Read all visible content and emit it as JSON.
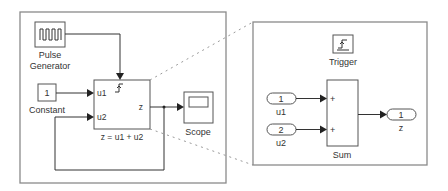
{
  "parent_model": {
    "pulse_generator": {
      "label_line1": "Pulse",
      "label_line2": "Generator",
      "icon": "pulse-wave-icon"
    },
    "constant": {
      "value": "1",
      "label": "Constant"
    },
    "subsystem": {
      "inputs": [
        "u1",
        "u2"
      ],
      "output": "z",
      "trigger_icon": "rising-edge-trigger-icon",
      "caption": "z = u1 + u2"
    },
    "scope": {
      "label": "Scope",
      "icon": "scope-screen-icon"
    }
  },
  "subsystem_contents": {
    "trigger": {
      "label": "Trigger",
      "icon": "rising-edge-trigger-icon"
    },
    "inports": [
      {
        "number": "1",
        "name": "u1"
      },
      {
        "number": "2",
        "name": "u2"
      }
    ],
    "sum": {
      "label": "Sum",
      "signs": [
        "+",
        "+"
      ]
    },
    "outport": {
      "number": "1",
      "name": "z"
    }
  },
  "colors": {
    "frame": "#8a8a8a",
    "block_border": "#555555",
    "wire": "#333333",
    "text": "#333333",
    "background": "#ffffff"
  }
}
